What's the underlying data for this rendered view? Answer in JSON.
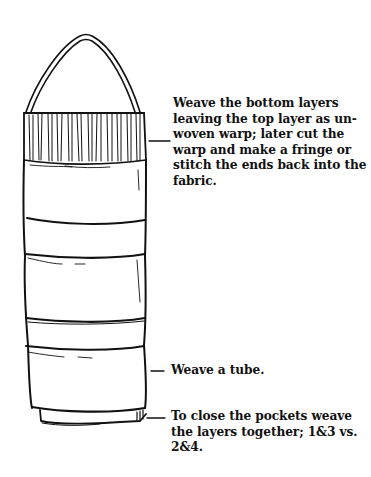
{
  "diagram": {
    "annotations": [
      {
        "id": "top",
        "lines": [
          "Weave the bottom layers",
          "leaving the top layer as un-",
          "woven warp; later cut the",
          "warp and make a fringe or",
          "stitch the ends back into the",
          "fabric."
        ]
      },
      {
        "id": "tube",
        "lines": [
          "Weave a tube."
        ]
      },
      {
        "id": "close",
        "lines": [
          "To close the pockets weave",
          "the layers together; 1&3 vs.",
          "2&4."
        ]
      }
    ],
    "colors": {
      "ink": "#111111",
      "paper": "#ffffff"
    }
  }
}
